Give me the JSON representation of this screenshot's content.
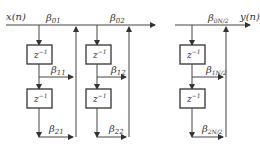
{
  "diagram": {
    "type": "cascade form filter block diagram (second-order sections)",
    "input_label": "x(n)",
    "output_label": "y(n)",
    "delay_label": "z",
    "delay_exponent": "−1",
    "sections": [
      {
        "b0": {
          "base": "β",
          "sub": "01"
        },
        "b1": {
          "base": "β",
          "sub": "11"
        },
        "b2": {
          "base": "β",
          "sub": "21"
        }
      },
      {
        "b0": {
          "base": "β",
          "sub": "02"
        },
        "b1": {
          "base": "β",
          "sub": "12"
        },
        "b2": {
          "base": "β",
          "sub": "22"
        }
      },
      {
        "b0": {
          "base": "β",
          "sub": "0N/2"
        },
        "b1": {
          "base": "β",
          "sub": "1N/2"
        },
        "b2": {
          "base": "β",
          "sub": "2N/2"
        }
      }
    ],
    "colors": {
      "line": "#444444",
      "text": "#333333",
      "background": "#ffffff"
    }
  }
}
